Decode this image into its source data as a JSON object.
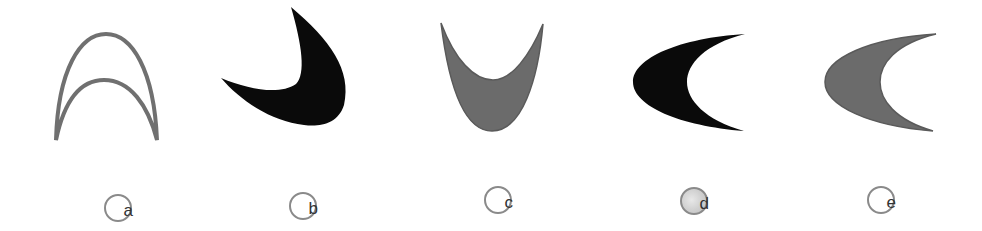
{
  "figure": {
    "colors": {
      "gray_fill": "#6b6b6b",
      "gray_stroke": "#707070",
      "black_fill": "#0a0a0a",
      "label_border": "#8a8a8a",
      "label_text": "#333333"
    },
    "options": [
      {
        "id": "a",
        "label": "a",
        "style": "outline",
        "fill": "none",
        "orientation": "arch-up"
      },
      {
        "id": "b",
        "label": "b",
        "style": "solid",
        "fill": "black",
        "orientation": "tilted-cup"
      },
      {
        "id": "c",
        "label": "c",
        "style": "solid",
        "fill": "gray",
        "orientation": "cup-up"
      },
      {
        "id": "d",
        "label": "d",
        "style": "solid",
        "fill": "black",
        "orientation": "crescent-open-right",
        "label_shaded": true
      },
      {
        "id": "e",
        "label": "e",
        "style": "solid",
        "fill": "gray",
        "orientation": "crescent-open-right"
      }
    ]
  }
}
